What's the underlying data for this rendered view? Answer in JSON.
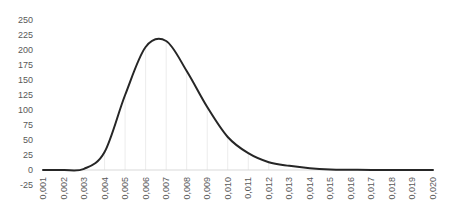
{
  "chart_data": {
    "type": "line",
    "title": "",
    "xlabel": "",
    "ylabel": "",
    "ylim": [
      -25,
      250
    ],
    "yticks": [
      250,
      225,
      200,
      175,
      150,
      125,
      100,
      75,
      50,
      25,
      0,
      -25
    ],
    "categories": [
      "0,001",
      "0,002",
      "0,003",
      "0,004",
      "0,005",
      "0,006",
      "0,007",
      "0,008",
      "0,009",
      "0,010",
      "0,011",
      "0,012",
      "0,013",
      "0,014",
      "0,015",
      "0,016",
      "0,017",
      "0,018",
      "0,019",
      "0,020"
    ],
    "series": [
      {
        "name": "Series 1",
        "color": "#262626",
        "values": [
          0,
          0,
          2,
          30,
          125,
          205,
          215,
          165,
          105,
          55,
          28,
          13,
          7,
          3,
          1,
          0.5,
          0,
          0,
          0,
          0
        ]
      }
    ],
    "grid": {
      "horizontal": false,
      "vertical": true
    },
    "legend": null
  }
}
